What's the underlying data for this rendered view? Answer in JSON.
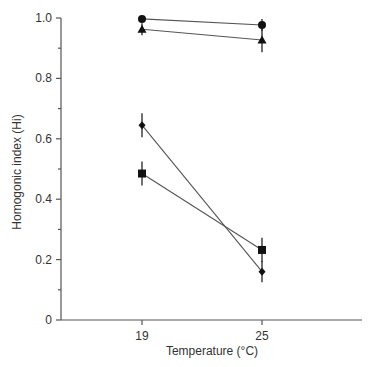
{
  "chart_data": {
    "type": "line",
    "title": "",
    "xlabel": "Temperature (°C)",
    "ylabel": "Homogonic index (Hi)",
    "x": [
      19,
      25
    ],
    "categories": [
      "19",
      "25"
    ],
    "ylim": [
      0,
      1.0
    ],
    "yticks": [
      0,
      0.2,
      0.4,
      0.6,
      0.8,
      1.0
    ],
    "ytick_labels": [
      "0",
      "0.2",
      "0.4",
      "0.6",
      "0.8",
      "1.0"
    ],
    "y_minor_ticks": [
      0.1,
      0.3,
      0.5,
      0.7,
      0.9
    ],
    "grid": false,
    "legend": null,
    "series": [
      {
        "name": "circle",
        "marker": "circle",
        "values": [
          0.997,
          0.977
        ],
        "errors": [
          0.01,
          0.02
        ]
      },
      {
        "name": "triangle",
        "marker": "triangle",
        "values": [
          0.963,
          0.927
        ],
        "errors": [
          0.02,
          0.04
        ]
      },
      {
        "name": "diamond",
        "marker": "diamond",
        "values": [
          0.645,
          0.16
        ],
        "errors": [
          0.04,
          0.035
        ]
      },
      {
        "name": "square",
        "marker": "square",
        "values": [
          0.485,
          0.232
        ],
        "errors": [
          0.04,
          0.04
        ]
      }
    ]
  }
}
